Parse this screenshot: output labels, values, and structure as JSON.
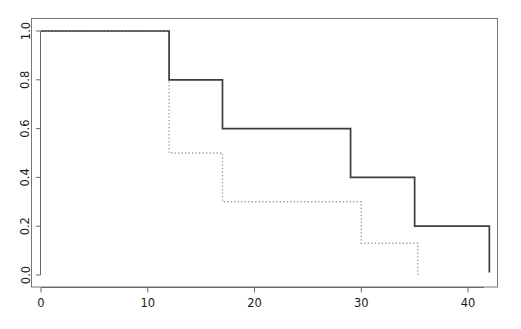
{
  "chart_data": {
    "type": "line",
    "title": "",
    "subtitle": "",
    "xlabel": "",
    "ylabel": "",
    "xlim": [
      0,
      43.5
    ],
    "ylim": [
      0,
      1.04
    ],
    "grid": false,
    "legend": null,
    "style": "step-post (Kaplan-Meier survival curves)",
    "xticks": [
      0,
      10,
      20,
      30,
      40
    ],
    "xtick_labels": [
      "0",
      "10",
      "20",
      "30",
      "40"
    ],
    "yticks": [
      0.0,
      0.2,
      0.4,
      0.6,
      0.8,
      1.0
    ],
    "ytick_labels": [
      "0.0",
      "0.2",
      "0.4",
      "0.6",
      "0.8",
      "1.0"
    ],
    "series": [
      {
        "name": "solid-curve",
        "linestyle": "solid",
        "color": "#3a3a3a",
        "linewidth": 1.6,
        "x": [
          0,
          12,
          12,
          17,
          17,
          29,
          29,
          35,
          35,
          42,
          42
        ],
        "y": [
          1.0,
          1.0,
          0.8,
          0.8,
          0.6,
          0.6,
          0.4,
          0.4,
          0.2,
          0.2,
          0.01
        ],
        "steps": [
          {
            "x_start": 0,
            "x_end": 12,
            "value": 1.0
          },
          {
            "x_start": 12,
            "x_end": 17,
            "value": 0.8
          },
          {
            "x_start": 17,
            "x_end": 29,
            "value": 0.6
          },
          {
            "x_start": 29,
            "x_end": 35,
            "value": 0.4
          },
          {
            "x_start": 35,
            "x_end": 42,
            "value": 0.2
          },
          {
            "x_start": 42,
            "x_end": 42,
            "value": 0.01
          }
        ]
      },
      {
        "name": "dotted-curve",
        "linestyle": "dotted",
        "color": "#9a9a9a",
        "linewidth": 1.4,
        "x": [
          0,
          12,
          12,
          17,
          17,
          30,
          30,
          35.3,
          35.3
        ],
        "y": [
          1.0,
          1.0,
          0.5,
          0.5,
          0.3,
          0.3,
          0.13,
          0.13,
          0.0
        ],
        "steps": [
          {
            "x_start": 0,
            "x_end": 12,
            "value": 1.0
          },
          {
            "x_start": 12,
            "x_end": 17,
            "value": 0.5
          },
          {
            "x_start": 17,
            "x_end": 30,
            "value": 0.3
          },
          {
            "x_start": 30,
            "x_end": 35.3,
            "value": 0.13
          },
          {
            "x_start": 35.3,
            "x_end": 35.3,
            "value": 0.0
          }
        ]
      }
    ]
  },
  "frame": {
    "box_color": "#6e6e6e",
    "axis_color": "#6e6e6e"
  }
}
